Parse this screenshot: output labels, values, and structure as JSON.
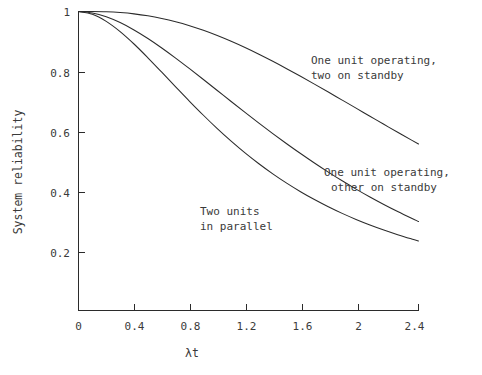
{
  "chart_data": {
    "type": "line",
    "title": "",
    "xlabel": "λt",
    "ylabel": "System reliability",
    "xlim": [
      0,
      2.45
    ],
    "ylim": [
      0,
      1
    ],
    "grid": false,
    "legend_position": "inline-annotations",
    "xticks": [
      0,
      0.4,
      0.8,
      1.2,
      1.6,
      2,
      2.4
    ],
    "xtick_labels": [
      "0",
      "0.4",
      "0.8",
      "1.2",
      "1.6",
      "2",
      "2.4"
    ],
    "yticks": [
      0.2,
      0.4,
      0.6,
      0.8,
      1
    ],
    "ytick_labels": [
      "0.2",
      "0.4",
      "0.6",
      "0.8",
      "1"
    ],
    "x": [
      0,
      0.1,
      0.2,
      0.3,
      0.4,
      0.5,
      0.6,
      0.7,
      0.8,
      0.9,
      1.0,
      1.1,
      1.2,
      1.3,
      1.4,
      1.5,
      1.6,
      1.7,
      1.8,
      1.9,
      2.0,
      2.1,
      2.2,
      2.3,
      2.4,
      2.45
    ],
    "series": [
      {
        "name": "One unit operating, two on standby",
        "annotation": "One unit operating,\ntwo on standby",
        "annotation_line1": "One unit operating,",
        "annotation_line2": "two on standby",
        "values": [
          1.0,
          0.9998,
          0.9989,
          0.9964,
          0.9921,
          0.9856,
          0.9769,
          0.9659,
          0.9526,
          0.9371,
          0.9197,
          0.9004,
          0.8795,
          0.8571,
          0.8335,
          0.8088,
          0.7834,
          0.7572,
          0.7306,
          0.7037,
          0.6767,
          0.6496,
          0.6227,
          0.596,
          0.5697,
          0.5567
        ]
      },
      {
        "name": "One unit operating, other on standby",
        "annotation": "One unit operating,\nother on standby",
        "annotation_line1": "One unit operating,",
        "annotation_line2": "other on standby",
        "values": [
          1.0,
          0.9953,
          0.9825,
          0.9631,
          0.9384,
          0.9098,
          0.8781,
          0.8442,
          0.8088,
          0.7725,
          0.7358,
          0.699,
          0.6626,
          0.6268,
          0.5918,
          0.5578,
          0.5249,
          0.4932,
          0.4628,
          0.4337,
          0.406,
          0.3796,
          0.3546,
          0.3309,
          0.3084,
          0.2977
        ]
      },
      {
        "name": "Two units in parallel",
        "annotation": "Two units\nin parallel",
        "annotation_line1": "Two units",
        "annotation_line2": "in parallel",
        "values": [
          1.0,
          0.9909,
          0.9671,
          0.9328,
          0.8913,
          0.8452,
          0.7969,
          0.748,
          0.6997,
          0.653,
          0.6084,
          0.5665,
          0.5272,
          0.4908,
          0.457,
          0.4259,
          0.3973,
          0.371,
          0.3469,
          0.3248,
          0.3046,
          0.2861,
          0.2692,
          0.2537,
          0.2395,
          0.2328
        ]
      }
    ],
    "colors": {
      "line": "#2b2b2b",
      "text": "#3a3a3a",
      "background": "#ffffff"
    }
  },
  "annotations": {
    "a1_line1": "One unit operating,",
    "a1_line2": "two on standby",
    "a2_line1": "One unit operating,",
    "a2_line2": "other on standby",
    "a3_line1": "Two units",
    "a3_line2": "in parallel"
  },
  "axes": {
    "y_title": "System reliability",
    "x_title": "λt"
  },
  "xticks": {
    "t0": "0",
    "t1": "0.4",
    "t2": "0.8",
    "t3": "1.2",
    "t4": "1.6",
    "t5": "2",
    "t6": "2.4"
  },
  "yticks": {
    "t1": "1",
    "t08": "0.8",
    "t06": "0.6",
    "t04": "0.4",
    "t02": "0.2"
  }
}
